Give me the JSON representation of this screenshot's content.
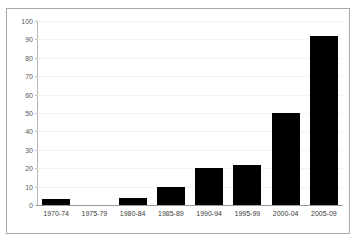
{
  "chart_data": {
    "type": "bar",
    "title": "",
    "subtitle": "",
    "xlabel": "",
    "ylabel": "",
    "categories": [
      "1970-74",
      "1975-79",
      "1980-84",
      "1985-89",
      "1990-94",
      "1995-99",
      "2000-04",
      "2005-09"
    ],
    "values": [
      3,
      0,
      4,
      10,
      20,
      22,
      50,
      92
    ],
    "ylim": [
      0,
      100
    ],
    "ytick_values": [
      0,
      10,
      20,
      30,
      40,
      50,
      60,
      70,
      80,
      90,
      100
    ],
    "ytick_labels": [
      "0",
      "10",
      "20",
      "30",
      "40",
      "50",
      "60",
      "70",
      "80",
      "90",
      "100"
    ],
    "grid": true,
    "legend": false,
    "legend_position": "none",
    "series": [
      {
        "name": "",
        "values": [
          3,
          0,
          4,
          10,
          20,
          22,
          50,
          92
        ]
      }
    ],
    "colors": {
      "bar": "#000000",
      "background": "#ffffff",
      "border": "#a9a9a9",
      "gridline": "#f2f2f2",
      "axis": "#9a9a9a",
      "ytick_text": "#5a5a5a",
      "xtick_text": "#3d3d3d"
    }
  }
}
